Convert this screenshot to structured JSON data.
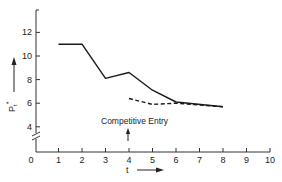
{
  "chart_data": {
    "type": "line",
    "title": "",
    "xlabel": "t",
    "ylabel": "P_t*",
    "xlim": [
      0,
      10
    ],
    "ylim": [
      4,
      13
    ],
    "y_axis_break": true,
    "grid": false,
    "legend": null,
    "x_ticks": [
      "0",
      "1",
      "2",
      "3",
      "4",
      "5",
      "6",
      "7",
      "8",
      "9",
      "10"
    ],
    "y_ticks": [
      "4",
      "6",
      "8",
      "10",
      "12"
    ],
    "series": [
      {
        "name": "Price path (solid)",
        "style": "solid",
        "x": [
          1,
          2,
          3,
          4,
          5,
          6,
          8
        ],
        "values": [
          11.0,
          11.0,
          8.1,
          8.6,
          7.1,
          6.1,
          5.7
        ]
      },
      {
        "name": "Price path after competitive entry (dashed)",
        "style": "dashed",
        "x": [
          4,
          5,
          6,
          8
        ],
        "values": [
          6.4,
          5.9,
          6.0,
          5.7
        ]
      }
    ],
    "annotations": [
      {
        "text": "Competitive Entry",
        "x": 4,
        "arrow": "up"
      }
    ]
  },
  "labels": {
    "y_axis": "P",
    "y_axis_sub": "t",
    "y_axis_sup": "*",
    "x_axis": "t",
    "annotation": "Competitive Entry"
  }
}
